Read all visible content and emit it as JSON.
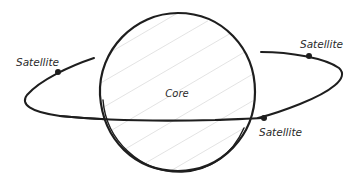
{
  "diagram": {
    "type": "orbit-sketch",
    "core": {
      "label": "Core",
      "shape": "circle",
      "fill": "hatched",
      "center": [
        177,
        92
      ],
      "radius": 79
    },
    "orbit": {
      "shape": "ellipse",
      "stroke_color": "#1e1e1e"
    },
    "satellites": [
      {
        "label": "Satellite",
        "position": "upper-left",
        "dot": [
          58,
          72
        ]
      },
      {
        "label": "Satellite",
        "position": "upper-right",
        "dot": [
          309,
          56
        ]
      },
      {
        "label": "Satellite",
        "position": "front-right",
        "dot": [
          265,
          118
        ]
      }
    ],
    "colors": {
      "ink": "#1e1e1e",
      "text": "#2a2a2a",
      "hatch": "#dcdcdc",
      "background": "#ffffff"
    }
  }
}
